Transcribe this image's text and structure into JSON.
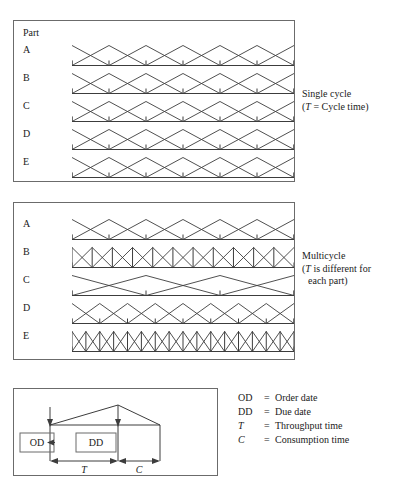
{
  "panels": {
    "single": {
      "header": "Part",
      "rows": [
        {
          "label": "A",
          "cycles": 6
        },
        {
          "label": "B",
          "cycles": 6
        },
        {
          "label": "C",
          "cycles": 6
        },
        {
          "label": "D",
          "cycles": 6
        },
        {
          "label": "E",
          "cycles": 6
        }
      ],
      "note_title": "Single cycle",
      "note_detail": "(T = Cycle time)",
      "note_detail_pre": "(",
      "note_detail_sym": "T",
      "note_detail_post": " = Cycle time)"
    },
    "multi": {
      "rows": [
        {
          "label": "A",
          "cycles": 6
        },
        {
          "label": "B",
          "cycles": 11
        },
        {
          "label": "C",
          "cycles": 3
        },
        {
          "label": "D",
          "cycles": 8
        },
        {
          "label": "E",
          "cycles": 16
        }
      ],
      "note_title": "Multicycle",
      "note_detail_pre": "(",
      "note_detail_sym": "T",
      "note_detail_post": " is different for",
      "note_detail_line2": "each part)"
    },
    "legend": {
      "box_order_date": "OD",
      "box_due_date": "DD",
      "dim_throughput": "T",
      "dim_consumption": "C"
    }
  },
  "definitions": [
    {
      "symbol": "OD",
      "italic": false,
      "eq": "=",
      "text": "Order date"
    },
    {
      "symbol": "DD",
      "italic": false,
      "eq": "=",
      "text": "Due date"
    },
    {
      "symbol": "T",
      "italic": true,
      "eq": "=",
      "text": "Throughput time"
    },
    {
      "symbol": "C",
      "italic": true,
      "eq": "=",
      "text": "Consumption time"
    }
  ],
  "chart_data": {
    "type": "line",
    "xlabel": "Time",
    "ylabel": "Inventory level",
    "grid": false,
    "legend_position": "right",
    "series": [
      {
        "panel": "single",
        "name": "A",
        "cycles": 6,
        "period_label": "T",
        "note": "uniform cycle time"
      },
      {
        "panel": "single",
        "name": "B",
        "cycles": 6,
        "period_label": "T",
        "note": "uniform cycle time"
      },
      {
        "panel": "single",
        "name": "C",
        "cycles": 6,
        "period_label": "T",
        "note": "uniform cycle time"
      },
      {
        "panel": "single",
        "name": "D",
        "cycles": 6,
        "period_label": "T",
        "note": "uniform cycle time"
      },
      {
        "panel": "single",
        "name": "E",
        "cycles": 6,
        "period_label": "T",
        "note": "uniform cycle time"
      },
      {
        "panel": "multi",
        "name": "A",
        "cycles": 6,
        "period_label": "T",
        "note": "part-specific cycle time"
      },
      {
        "panel": "multi",
        "name": "B",
        "cycles": 11,
        "period_label": "T",
        "note": "part-specific cycle time"
      },
      {
        "panel": "multi",
        "name": "C",
        "cycles": 3,
        "period_label": "T",
        "note": "part-specific cycle time"
      },
      {
        "panel": "multi",
        "name": "D",
        "cycles": 8,
        "period_label": "T",
        "note": "part-specific cycle time"
      },
      {
        "panel": "multi",
        "name": "E",
        "cycles": 16,
        "period_label": "T",
        "note": "part-specific cycle time"
      }
    ]
  }
}
